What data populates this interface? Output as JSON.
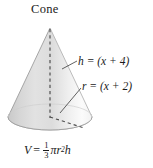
{
  "figure": {
    "title": "Cone",
    "background_color": "#ffffff",
    "ink_color": "#1a1a1a",
    "labels": {
      "height_label": "h = (x + 4)",
      "radius_label": "r = (x + 2)"
    },
    "formula": {
      "lhs": "V",
      "equals": "=",
      "fraction_numerator": "1",
      "fraction_denominator": "3",
      "pi": "π",
      "radius_symbol": "r",
      "radius_exponent": "2",
      "height_symbol": "h",
      "plain_text": "V = 1/3 πr²h"
    },
    "shape": {
      "kind": "cone",
      "apex": {
        "x": 50,
        "y": 28
      },
      "base_center": {
        "x": 50,
        "y": 117
      },
      "base_radius_x": 42,
      "base_radius_y": 13,
      "body_fill": "#dddddd",
      "body_fill_light": "#f6f6f6",
      "body_fill_dark": "#c9c9c9",
      "base_fill": "#e8e8e8",
      "outline_color": "#9a9a9a",
      "dash_color": "#555555"
    },
    "annotations": {
      "height_dashes": "vertical dashed segment from apex to base center",
      "radius_dashes": "dashed segment from base center to base rim",
      "leader_height": "line from h label to cone right slant",
      "leader_radius": "line from r label to base rim"
    }
  }
}
